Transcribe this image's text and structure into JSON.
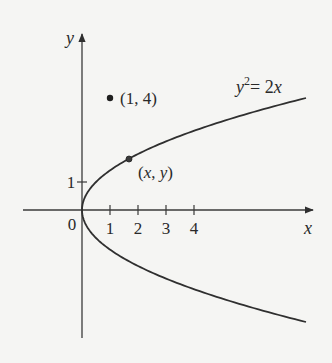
{
  "figure": {
    "type": "parabola-diagram",
    "equation_label": {
      "lhs": "y",
      "exp": "2",
      "rhs": "= 2",
      "var": "x"
    },
    "axes": {
      "x_label": "x",
      "y_label": "y",
      "origin_label": "0",
      "x_ticks": [
        "1",
        "2",
        "3",
        "4"
      ],
      "y_ticks": [
        "1"
      ]
    },
    "points": [
      {
        "label": "(1, 4)",
        "x": 1,
        "y": 4
      },
      {
        "label": "(x, y)",
        "x": 1.68,
        "y": 1.83
      }
    ],
    "colors": {
      "background": "#f5f5f3",
      "ink": "#2f2f2f"
    }
  },
  "chart_data": {
    "type": "line",
    "title": "",
    "xlabel": "x",
    "ylabel": "y",
    "curve": "y^2 = 2x",
    "x_ticks": [
      1,
      2,
      3,
      4
    ],
    "y_ticks": [
      1
    ],
    "xlim": [
      -2,
      8.3
    ],
    "ylim": [
      -4.6,
      6.2
    ],
    "annotations": [
      {
        "text": "(1, 4)",
        "x": 1,
        "y": 4
      },
      {
        "text": "(x, y)",
        "x": 1.68,
        "y": 1.83
      },
      {
        "text": "y^2 = 2x",
        "x": 6.5,
        "y": 4.4
      }
    ],
    "grid": false
  }
}
